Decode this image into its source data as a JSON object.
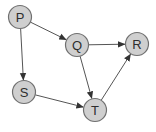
{
  "diagram": {
    "type": "directed-graph",
    "colors": {
      "node_fill": "#cfcfcf",
      "node_stroke": "#707070",
      "edge": "#555555",
      "label": "#2e2e2e",
      "background": "#ffffff"
    },
    "node_radius": 11.5,
    "nodes": [
      {
        "id": "P",
        "label": "P",
        "x": 20,
        "y": 17
      },
      {
        "id": "Q",
        "label": "Q",
        "x": 77,
        "y": 45
      },
      {
        "id": "R",
        "label": "R",
        "x": 137,
        "y": 44
      },
      {
        "id": "S",
        "label": "S",
        "x": 24,
        "y": 92
      },
      {
        "id": "T",
        "label": "T",
        "x": 95,
        "y": 110
      }
    ],
    "edges": [
      {
        "from": "P",
        "to": "Q"
      },
      {
        "from": "P",
        "to": "S"
      },
      {
        "from": "Q",
        "to": "R"
      },
      {
        "from": "Q",
        "to": "T"
      },
      {
        "from": "S",
        "to": "T"
      },
      {
        "from": "T",
        "to": "R"
      }
    ]
  }
}
